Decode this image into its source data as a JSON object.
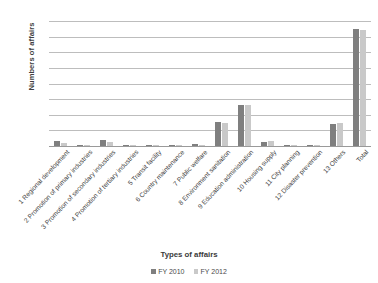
{
  "chart_data": {
    "type": "bar",
    "title": "",
    "xlabel": "Types of affairs",
    "ylabel": "Numbers of affairs",
    "ylim": [
      0,
      4000
    ],
    "ytick_step": 500,
    "yticks": [
      "0",
      "500",
      "1000",
      "1500",
      "2000",
      "2500",
      "3000",
      "3500",
      "4000"
    ],
    "grid": true,
    "legend_position": "bottom",
    "categories": [
      "1 Regional development",
      "2 Promotion of primary industries",
      "3 Promotion of secondary industries",
      "4 Promotion of tertiary industries",
      "5 Transit facility",
      "6 Country maintenance",
      "7 Public welfare",
      "8 Environment sanitation",
      "9 Education administration",
      "10 Housing supply",
      "11 City planning",
      "12 Disaster prevention",
      "13 Others",
      "Total"
    ],
    "series": [
      {
        "name": "FY 2010",
        "color": "#7f7f7f",
        "values": [
          170,
          30,
          200,
          40,
          15,
          30,
          50,
          780,
          1310,
          130,
          20,
          15,
          700,
          3740
        ]
      },
      {
        "name": "FY 2012",
        "color": "#c9c9c9",
        "values": [
          90,
          25,
          120,
          30,
          15,
          25,
          45,
          740,
          1300,
          150,
          20,
          15,
          740,
          3720
        ]
      }
    ]
  },
  "legend": {
    "items": [
      {
        "label": "FY 2010",
        "color": "#7f7f7f"
      },
      {
        "label": "FY 2012",
        "color": "#c9c9c9"
      }
    ]
  }
}
